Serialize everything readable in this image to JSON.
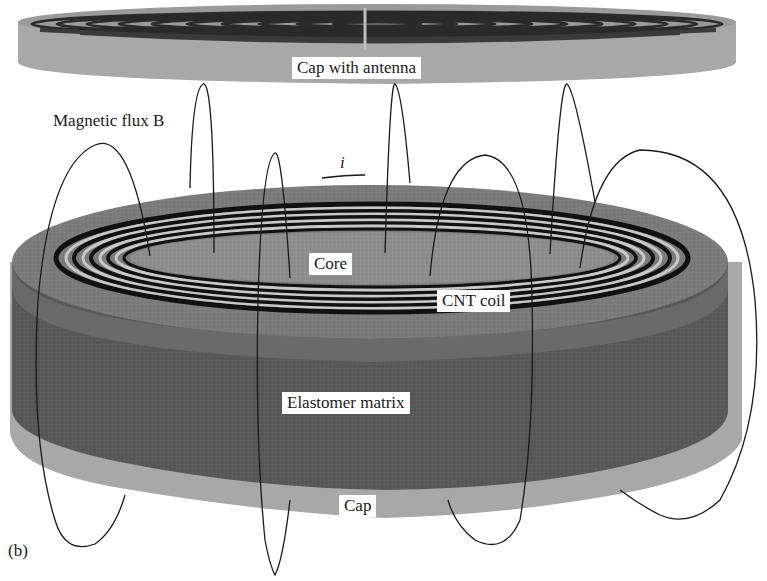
{
  "figure": {
    "panel_label": "(b)",
    "labels": {
      "cap_with_antenna": "Cap with antenna",
      "magnetic_flux": "Magnetic flux B",
      "current": "i",
      "core": "Core",
      "cnt_coil": "CNT coil",
      "elastomer_matrix": "Elastomer matrix",
      "cap": "Cap"
    },
    "colors": {
      "background": "#ffffff",
      "cap_light_gray": "#a8a8a8",
      "cap_top_gray": "#9a9a9a",
      "body_dark_gray": "#5a5a5a",
      "top_face_gray": "#7d7d7d",
      "core_gray": "#8e8e8e",
      "coil_black": "#111111",
      "coil_gap_light": "#c8c8c8",
      "flux_line": "#1a1a1a",
      "label_bg": "#ffffff"
    }
  }
}
